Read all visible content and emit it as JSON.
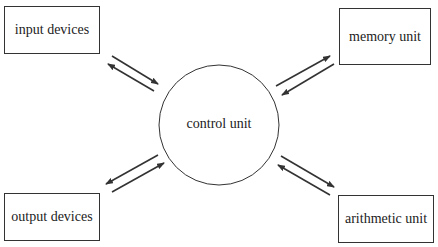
{
  "diagram": {
    "center": {
      "label": "control unit"
    },
    "nodes": [
      {
        "id": "input",
        "label": "input devices"
      },
      {
        "id": "memory",
        "label": "memory unit"
      },
      {
        "id": "output",
        "label": "output devices"
      },
      {
        "id": "arithmetic",
        "label": "arithmetic unit"
      }
    ],
    "edges": [
      {
        "from": "input devices",
        "to": "control unit",
        "bidirectional": true
      },
      {
        "from": "memory unit",
        "to": "control unit",
        "bidirectional": true
      },
      {
        "from": "output devices",
        "to": "control unit",
        "bidirectional": true
      },
      {
        "from": "arithmetic unit",
        "to": "control unit",
        "bidirectional": true
      }
    ],
    "colors": {
      "stroke": "#333333",
      "background": "#ffffff"
    }
  }
}
